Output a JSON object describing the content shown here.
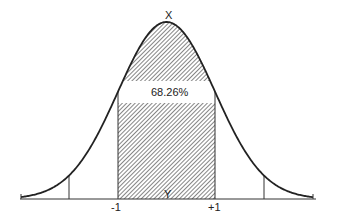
{
  "diagram": {
    "type": "normal-distribution",
    "peak_label": "X",
    "center_label": "Y",
    "area_label": "68.26%",
    "tick_labels": [
      "-1",
      "+1"
    ],
    "colors": {
      "line": "#222222",
      "hatch": "#333333",
      "background": "#ffffff"
    }
  }
}
